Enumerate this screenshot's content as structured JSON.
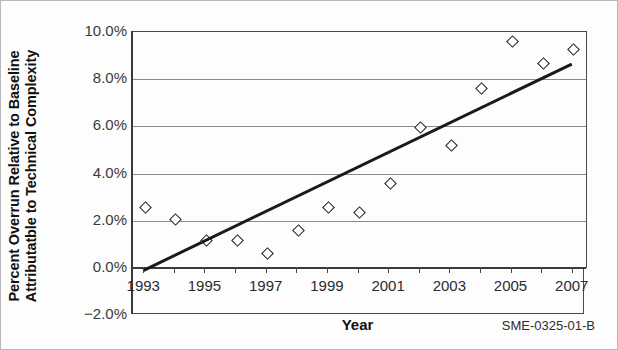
{
  "chart_data": {
    "type": "scatter",
    "title": "",
    "xlabel": "Year",
    "ylabel": "Percent Overrun Relative to Baseline Attributatble to Technical Complexity",
    "ylabel_line1": "Percent Overrun Relative to Baseline",
    "ylabel_line2": "Attributatble to Technical Complexity",
    "x": [
      1993,
      1994,
      1995,
      1996,
      1997,
      1998,
      1999,
      2000,
      2001,
      2002,
      2003,
      2004,
      2005,
      2006,
      2007
    ],
    "values": [
      2.55,
      2.05,
      1.15,
      1.15,
      0.6,
      1.6,
      2.55,
      2.35,
      3.6,
      5.95,
      5.2,
      7.6,
      9.6,
      8.65,
      9.25
    ],
    "series": [
      {
        "name": "Percent Overrun",
        "marker": "diamond",
        "values": [
          2.55,
          2.05,
          1.15,
          1.15,
          0.6,
          1.6,
          2.55,
          2.35,
          3.6,
          5.95,
          5.2,
          7.6,
          9.6,
          8.65,
          9.25
        ]
      },
      {
        "name": "Linear trend line",
        "type": "line",
        "x_endpoints": [
          1993,
          2007
        ],
        "y_endpoints": [
          -0.15,
          8.6
        ]
      }
    ],
    "xlim": [
      1992.6,
      2007.4
    ],
    "ylim": [
      -2.0,
      10.0
    ],
    "ytick_labels": [
      "10.0%",
      "8.0%",
      "6.0%",
      "4.0%",
      "2.0%",
      "0.0%",
      "-2.0%"
    ],
    "ytick_values": [
      10.0,
      8.0,
      6.0,
      4.0,
      2.0,
      0.0,
      -2.0
    ],
    "xtick_labels": [
      "1993",
      "1995",
      "1997",
      "1999",
      "2001",
      "2003",
      "2005",
      "2007"
    ],
    "xtick_values": [
      1993,
      1995,
      1997,
      1999,
      2001,
      2003,
      2005,
      2007
    ],
    "grid": "horizontal",
    "legend": "none",
    "source_note": "SME-0325-01-B",
    "colors": {
      "marker_edge": "#1a1a1a",
      "marker_fill": "#ffffff",
      "trend_line": "#1a1a1a",
      "gridline": "#8b8b8b",
      "axis": "#3a3a3a",
      "text": "#111111"
    }
  }
}
